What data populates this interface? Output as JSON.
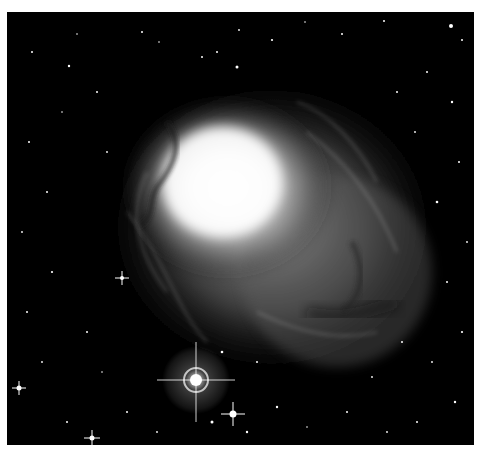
{
  "image": {
    "subject": "nebula-photograph",
    "background_color": "#000000",
    "frame_color": "#ffffff",
    "bright_stars": [
      {
        "x": 189,
        "y": 368,
        "r": 6,
        "halo": 34
      },
      {
        "x": 226,
        "y": 402,
        "r": 4,
        "halo": 0
      },
      {
        "x": 85,
        "y": 426,
        "r": 3,
        "halo": 0
      },
      {
        "x": 12,
        "y": 376,
        "r": 3,
        "halo": 0
      },
      {
        "x": 115,
        "y": 266,
        "r": 3,
        "halo": 0
      },
      {
        "x": 252,
        "y": 238,
        "r": 2,
        "halo": 0
      }
    ]
  }
}
